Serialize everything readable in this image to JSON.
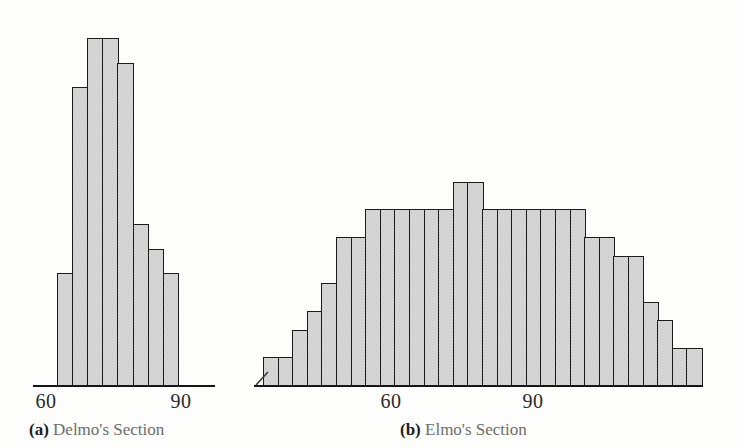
{
  "figure": {
    "background_color": "#fdfdfb",
    "bar_fill_color": "#c9c9c9",
    "bar_border_color": "#1b1b1b",
    "axis_color": "#161616",
    "caption_color": "#6d6d6d"
  },
  "chart_data": [
    {
      "type": "bar",
      "id": "delmo-histogram",
      "title": "(a) Delmo's Section",
      "caption_tag": "(a)",
      "caption_text": "Delmo's Section",
      "xlabel": "",
      "ylabel": "",
      "grid": false,
      "legend": "none",
      "xtick_labels": [
        "60",
        "90"
      ],
      "xtick_values": [
        60,
        90
      ],
      "bin_width": 5,
      "bin_starts": [
        65,
        70,
        75,
        80,
        85,
        90,
        95,
        100
      ],
      "categories": [
        "65",
        "70",
        "75",
        "80",
        "85",
        "90",
        "95",
        "100"
      ],
      "values": [
        9,
        24,
        28,
        28,
        26,
        13,
        11,
        9
      ],
      "ylim": [
        0,
        30
      ]
    },
    {
      "type": "bar",
      "id": "elmo-histogram",
      "title": "(b) Elmo's Section",
      "caption_tag": "(b)",
      "caption_text": "Elmo's Section",
      "xlabel": "",
      "ylabel": "",
      "grid": false,
      "legend": "none",
      "axis_break": true,
      "xtick_labels": [
        "60",
        "90"
      ],
      "xtick_values": [
        60,
        90
      ],
      "bin_width": 3,
      "categories": [
        "b1",
        "b2",
        "b3",
        "b4",
        "b5",
        "b6",
        "b7",
        "b8",
        "b9",
        "b10",
        "b11",
        "b12",
        "b13",
        "b14",
        "b15",
        "b16",
        "b17",
        "b18",
        "b19",
        "b20",
        "b21",
        "b22",
        "b23",
        "b24",
        "b25",
        "b26",
        "b27",
        "b28",
        "b29",
        "b30"
      ],
      "values": [
        3,
        3,
        6,
        8,
        11,
        16,
        16,
        19,
        19,
        19,
        19,
        19,
        19,
        22,
        22,
        19,
        19,
        19,
        19,
        19,
        19,
        19,
        16,
        16,
        14,
        14,
        9,
        7,
        4,
        4
      ],
      "ylim": [
        0,
        24
      ]
    }
  ],
  "panel_a": {
    "caption_tag": "(a)",
    "caption_text": "Delmo's Section",
    "tick_60": "60",
    "tick_90": "90"
  },
  "panel_b": {
    "caption_tag": "(b)",
    "caption_text": "Elmo's Section",
    "tick_60": "60",
    "tick_90": "90"
  }
}
